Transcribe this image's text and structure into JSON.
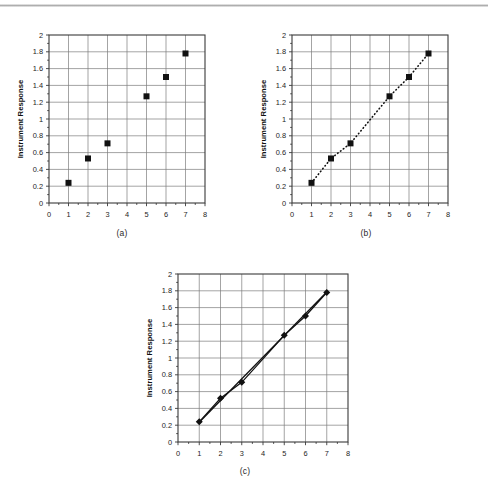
{
  "figure": {
    "background": "#ffffff",
    "rule_color": "#b9b9b9",
    "marker_color": "#111111",
    "grid_color": "#7d7d7d",
    "frame_color": "#3a3a3a"
  },
  "panels": [
    {
      "id": "a",
      "caption": "(a)",
      "chart_data": {
        "type": "scatter",
        "title": "",
        "xlabel": "Concentration of the Standard (mg/mL)",
        "ylabel": "Instrument Response",
        "xlim": [
          0,
          8
        ],
        "ylim": [
          0,
          2
        ],
        "xticks": [
          "0",
          "1",
          "2",
          "3",
          "4",
          "5",
          "6",
          "7",
          "8"
        ],
        "yticks": [
          "0",
          "0.2",
          "0.4",
          "0.6",
          "0.8",
          "1",
          "1.2",
          "1.4",
          "1.6",
          "1.8",
          "2"
        ],
        "grid": true,
        "legend": "none",
        "series": [
          {
            "name": "Standards",
            "marker": "square",
            "line": "none",
            "x": [
              1,
              2,
              3,
              5,
              6,
              7
            ],
            "y": [
              0.24,
              0.53,
              0.71,
              1.27,
              1.5,
              1.78
            ]
          }
        ]
      }
    },
    {
      "id": "b",
      "caption": "(b)",
      "chart_data": {
        "type": "scatter",
        "title": "",
        "xlabel": "Concentration of the Standard (mg/mL)",
        "ylabel": "Instrument Response",
        "xlim": [
          0,
          8
        ],
        "ylim": [
          0,
          2
        ],
        "xticks": [
          "0",
          "1",
          "2",
          "3",
          "4",
          "5",
          "6",
          "7",
          "8"
        ],
        "yticks": [
          "0",
          "0.2",
          "0.4",
          "0.6",
          "0.8",
          "1",
          "1.2",
          "1.4",
          "1.6",
          "1.8",
          "2"
        ],
        "grid": true,
        "legend": "none",
        "series": [
          {
            "name": "Standards",
            "marker": "square",
            "line": "dotted",
            "x": [
              1,
              2,
              3,
              5,
              6,
              7
            ],
            "y": [
              0.24,
              0.53,
              0.71,
              1.27,
              1.5,
              1.78
            ]
          }
        ]
      }
    },
    {
      "id": "c",
      "caption": "(c)",
      "chart_data": {
        "type": "scatter",
        "title": "",
        "xlabel": "Concentration of the Standard (mg/mL)",
        "ylabel": "Instrument Response",
        "xlim": [
          0,
          8
        ],
        "ylim": [
          0,
          2
        ],
        "xticks": [
          "0",
          "1",
          "2",
          "3",
          "4",
          "5",
          "6",
          "7",
          "8"
        ],
        "yticks": [
          "0",
          "0.2",
          "0.4",
          "0.6",
          "0.8",
          "1",
          "1.2",
          "1.4",
          "1.6",
          "1.8",
          "2"
        ],
        "grid": true,
        "legend": "none",
        "series": [
          {
            "name": "Standards",
            "marker": "diamond",
            "line": "solid",
            "x": [
              1,
              2,
              3,
              5,
              6,
              7
            ],
            "y": [
              0.24,
              0.52,
              0.71,
              1.27,
              1.5,
              1.78
            ]
          }
        ],
        "fit_line": {
          "name": "Least-squares fit",
          "x": [
            1,
            7
          ],
          "y": [
            0.235,
            1.785
          ]
        }
      }
    }
  ]
}
